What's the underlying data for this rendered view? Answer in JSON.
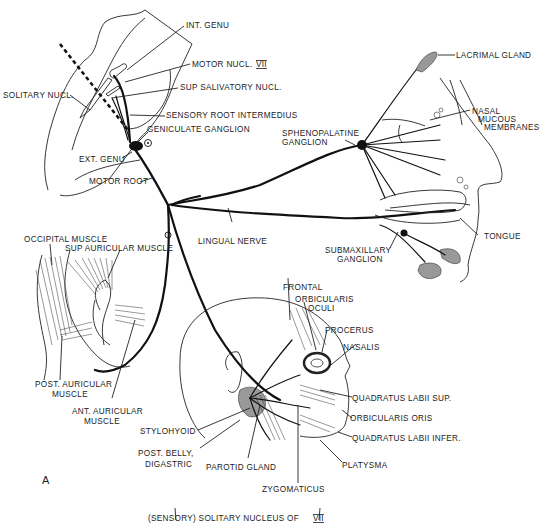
{
  "figure": {
    "panel_letter": "A",
    "brainstem": {
      "labels": {
        "int_genu": "INT. GENU",
        "motor_nucl": "MOTOR NUCL.",
        "motor_nucl_numeral": "VII",
        "sup_salivatory": "SUP SALIVATORY NUCL.",
        "solitary_nucl": "SOLITARY NUCL.",
        "sensory_root": "SENSORY ROOT INTERMEDIUS",
        "geniculate_ganglion": "GENICULATE GANGLION",
        "ext_genu": "EXT. GENU",
        "motor_root": "MOTOR ROOT"
      }
    },
    "nose_mouth": {
      "labels": {
        "lacrimal_gland": "LACRIMAL GLAND",
        "nasal_1": "NASAL",
        "nasal_2": "MUCOUS",
        "nasal_3": "MEMBRANES",
        "sphenopalatine_1": "SPHENOPALATINE",
        "sphenopalatine_2": "GANGLION",
        "tongue": "TONGUE",
        "submaxillary_1": "SUBMAXILLARY",
        "submaxillary_2": "GANGLION",
        "lingual_nerve": "LINGUAL NERVE"
      }
    },
    "ear": {
      "labels": {
        "occipital": "OCCIPITAL MUSCLE",
        "sup_auricular": "SUP AURICULAR MUSCLE",
        "post_auricular_1": "POST. AURICULAR",
        "post_auricular_2": "MUSCLE",
        "ant_auricular_1": "ANT. AURICULAR",
        "ant_auricular_2": "MUSCLE"
      }
    },
    "face": {
      "labels": {
        "frontal": "FRONTAL",
        "orbicularis_oculi_1": "ORBICULARIS",
        "orbicularis_oculi_2": "OCULI",
        "procerus": "PROCERUS",
        "nasalis": "NASALIS",
        "quadratus_sup": "QUADRATUS LABII SUP.",
        "orbicularis_oris": "ORBICULARIS ORIS",
        "quadratus_infer": "QUADRATUS LABII INFER.",
        "platysma": "PLATYSMA",
        "zygomaticus": "ZYGOMATICUS",
        "parotid": "PAROTID GLAND",
        "stylohyoid": "STYLOHYOID",
        "post_belly_1": "POST. BELLY,",
        "post_belly_2": "DIGASTRIC"
      }
    },
    "bottom_caption": {
      "text": "(SENSORY) SOLITARY NUCLEUS OF",
      "numeral": "VII"
    }
  }
}
